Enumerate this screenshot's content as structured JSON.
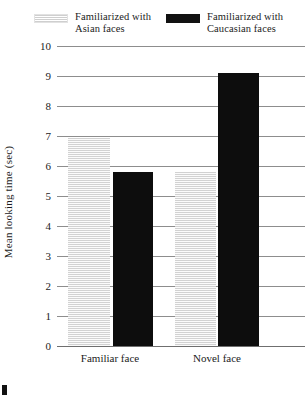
{
  "legend": {
    "entries": [
      {
        "label": "Familiarized with\nAsian faces",
        "swatch": "hatched-light-swatch",
        "color": "#d2d2d2"
      },
      {
        "label": "Familiarized with\nCaucasian faces",
        "swatch": "solid-black-swatch",
        "color": "#0d0d0d"
      }
    ]
  },
  "axis": {
    "y_title": "Mean looking time (sec)",
    "ticks": [
      "10",
      "9",
      "8",
      "7",
      "6",
      "5",
      "4",
      "3",
      "2",
      "1",
      "0"
    ]
  },
  "xlabels": [
    "Familiar face",
    "Novel face"
  ],
  "chart_data": {
    "type": "bar",
    "title": "",
    "xlabel": "",
    "ylabel": "Mean looking time (sec)",
    "ylim": [
      0,
      10
    ],
    "ytick_values": [
      0,
      1,
      2,
      3,
      4,
      5,
      6,
      7,
      8,
      9,
      10
    ],
    "grid": true,
    "legend_position": "top",
    "categories": [
      "Familiar face",
      "Novel face"
    ],
    "series": [
      {
        "name": "Familiarized with Asian faces",
        "color": "#d2d2d2",
        "values": [
          6.95,
          5.8
        ]
      },
      {
        "name": "Familiarized with Caucasian faces",
        "color": "#0d0d0d",
        "values": [
          5.8,
          9.1
        ]
      }
    ]
  }
}
